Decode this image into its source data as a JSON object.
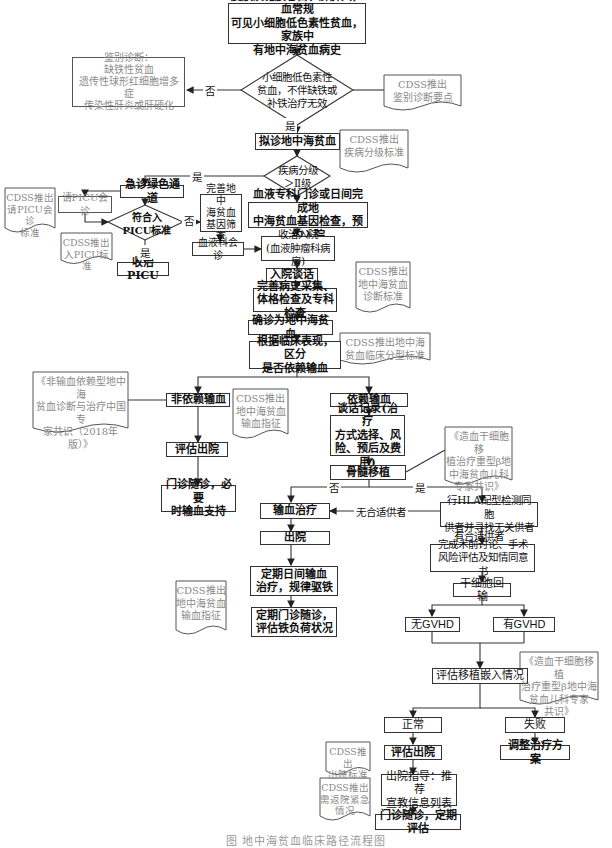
{
  "title": "地中海贫血临床路径流程图",
  "caption": "图 地中海贫血临床路径流程图",
  "nodes": {
    "start": "皮肤及黏膜苍白、肝脾大，血常规\n可见小细胞低色素性贫血，家族中\n有地中海贫血病史",
    "decision_microcytic": "小细胞低色素性\n贫血，不伴缺铁或\n补铁治疗无效",
    "differential": "鉴别诊断：\n缺铁性贫血\n遗传性球形红细胞增多症\n传染性肝炎或肝硬化",
    "suspected": "拟诊地中海贫血",
    "decision_grade": "疾病分级\n＞Ⅱ级",
    "emergency": "急诊绿色通道",
    "picu_consult": "请PICU会诊",
    "decision_picu": "符合入\nPICU标准",
    "admit_picu": "收治PICU",
    "gene_screen": "完善地中\n海贫血\n基因筛查",
    "hema_consult": "血液科会诊",
    "outpatient": "血液专科门诊或日间完成地\n中海贫血基因检查，预约入院",
    "admit": "收治入院\n(血液肿瘤科病房)",
    "talk": "入院谈话",
    "history": "完善病史采集、\n体格检查及专科检查",
    "confirm": "确诊为地中海贫血",
    "classify": "根据临床表现，区分\n是否依赖输血",
    "non_dependent": "非依赖输血",
    "eval_discharge_1": "评估出院",
    "followup_1": "门诊随诊，必要\n时输血支持",
    "dependent": "依赖输血",
    "talk_record": "谈话记录(治疗\n方式选择、风\n险、预后及费用)",
    "bmt": "骨髓移植",
    "transfusion": "输血治疗",
    "discharge": "出院",
    "regular_transfusion": "定期日间输血\n治疗，规律驱铁",
    "regular_followup": "定期门诊随诊，\n评估铁负荷状况",
    "hla": "行HLA配型检测同胞\n供者并寻找无关供者",
    "pre_op": "完成术前讨论、手术\n风险评估及知情同意书",
    "stem_cell": "干细胞回输",
    "no_gvhd": "无GVHD",
    "gvhd": "有GVHD",
    "engraft": "评估移植嵌入情况",
    "normal": "正常",
    "failure": "失败",
    "eval_discharge_2": "评估出院",
    "adjust": "调整治疗方案",
    "discharge_guide": "出院指导：推荐\n宣教信息列表",
    "final_followup": "门诊随诊，定期评估"
  },
  "docs": {
    "cdss_differential": "CDSS推出\n鉴别诊断要点",
    "cdss_grade": "CDSS推出\n疾病分级标准",
    "cdss_picu_consult": "CDSS推出\n请PICU会诊\n标准",
    "cdss_picu_admit": "CDSS推出\n入PICU标准",
    "cdss_diag_std": "CDSS推出\n地中海贫血\n诊断标准",
    "cdss_clinical_type": "CDSS推出地中海\n贫血临床分型标准",
    "consensus_ntdt": "《非输血依赖型地中海\n贫血诊断与治疗中国专\n家共识（2018年版）》",
    "cdss_transfusion_1": "CDSS推出\n地中海贫血\n输血指征",
    "consensus_hsct_1": "《造血干细胞移\n植治疗重型β地\n中海贫血儿科\n专家共识》",
    "cdss_transfusion_2": "CDSS推出\n地中海贫血\n输血指征",
    "consensus_hsct_2": "《造血干细胞移植\n治疗重型β地中海\n贫血儿科专家\n共识》",
    "cdss_discharge": "CDSS推出\n出院标准",
    "cdss_return": "CDSS推出\n需返院紧急\n情况"
  },
  "labels": {
    "no": "否",
    "yes": "是",
    "no_donor": "无合适供者",
    "has_donor": "有合适供者"
  }
}
